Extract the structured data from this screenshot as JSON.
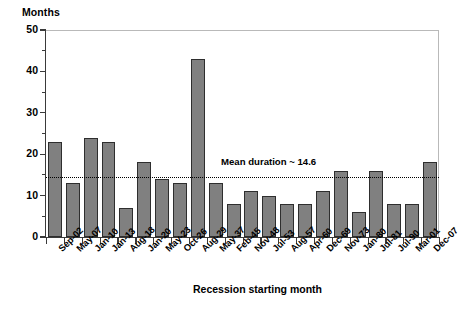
{
  "chart_data": {
    "type": "bar",
    "title": "",
    "ylabel": "Months",
    "xlabel": "Recession starting month",
    "ylim": [
      0,
      50
    ],
    "ytick_step": 10,
    "yminor_step": 5,
    "grid": false,
    "legend": null,
    "ytick_labels": [
      "50",
      "40",
      "30",
      "20",
      "10",
      "0"
    ],
    "categories": [
      "Sep-02",
      "May-07",
      "Jan-10",
      "Jan-13",
      "Aug-18",
      "Jan-20",
      "May-23",
      "Oct-26",
      "Aug-29",
      "May-37",
      "Feb-45",
      "Nov-48",
      "Jul-53",
      "Aug-57",
      "Apr-60",
      "Dec-69",
      "Nov-73",
      "Jan-80",
      "Jul-81",
      "Jul-90",
      "Mar-01",
      "Dec-07"
    ],
    "values": [
      23,
      13,
      24,
      23,
      7,
      18,
      14,
      13,
      43,
      13,
      8,
      11,
      10,
      8,
      8,
      11,
      16,
      6,
      16,
      8,
      8,
      18
    ],
    "bar_color": "#808080",
    "bar_edge_color": "#2e2e2e",
    "annotations": [
      {
        "name": "mean-duration",
        "text": "Mean duration ~ 14.6",
        "value": 14.6,
        "style": "dotted-horizontal-line"
      }
    ]
  }
}
